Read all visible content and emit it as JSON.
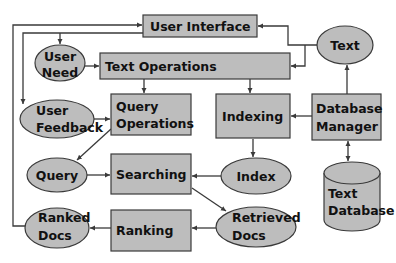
{
  "diagram": {
    "colors": {
      "background": "#ffffff",
      "node_fill": "#bdbdbd",
      "node_stroke": "#3a3a3a",
      "edge": "#3a3a3a",
      "text": "#111111"
    },
    "nodes": {
      "user_interface": {
        "shape": "rect",
        "lines": [
          "User Interface"
        ]
      },
      "text_operations": {
        "shape": "rect",
        "lines": [
          "Text Operations"
        ]
      },
      "query_operations": {
        "shape": "rect",
        "lines": [
          "Query",
          "Operations"
        ]
      },
      "indexing": {
        "shape": "rect",
        "lines": [
          "Indexing"
        ]
      },
      "database_manager": {
        "shape": "rect",
        "lines": [
          "Database",
          "Manager"
        ]
      },
      "searching": {
        "shape": "rect",
        "lines": [
          "Searching"
        ]
      },
      "ranking": {
        "shape": "rect",
        "lines": [
          "Ranking"
        ]
      },
      "user_need": {
        "shape": "ellipse",
        "lines": [
          "User",
          "Need"
        ]
      },
      "user_feedback": {
        "shape": "ellipse",
        "lines": [
          "User",
          "Feedback"
        ]
      },
      "text": {
        "shape": "ellipse",
        "lines": [
          "Text"
        ]
      },
      "query": {
        "shape": "ellipse",
        "lines": [
          "Query"
        ]
      },
      "index": {
        "shape": "ellipse",
        "lines": [
          "Index"
        ]
      },
      "retrieved_docs": {
        "shape": "ellipse",
        "lines": [
          "Retrieved",
          "Docs"
        ]
      },
      "ranked_docs": {
        "shape": "ellipse",
        "lines": [
          "Ranked",
          "Docs"
        ]
      },
      "text_database": {
        "shape": "cylinder",
        "lines": [
          "Text",
          "Database"
        ]
      }
    },
    "edges": [
      {
        "from": "text",
        "to": "user_interface"
      },
      {
        "from": "text",
        "to": "text_operations"
      },
      {
        "from": "user_interface",
        "to": "user_need"
      },
      {
        "from": "user_interface",
        "to": "user_feedback"
      },
      {
        "from": "user_need",
        "to": "text_operations"
      },
      {
        "from": "text_operations",
        "to": "query_operations"
      },
      {
        "from": "text_operations",
        "to": "indexing"
      },
      {
        "from": "user_feedback",
        "to": "query_operations"
      },
      {
        "from": "query_operations",
        "to": "query"
      },
      {
        "from": "database_manager",
        "to": "indexing"
      },
      {
        "from": "database_manager",
        "to": "text"
      },
      {
        "from": "database_manager",
        "to": "text_database",
        "bidirectional": true
      },
      {
        "from": "indexing",
        "to": "index"
      },
      {
        "from": "query",
        "to": "searching"
      },
      {
        "from": "index",
        "to": "searching"
      },
      {
        "from": "searching",
        "to": "retrieved_docs"
      },
      {
        "from": "retrieved_docs",
        "to": "ranking"
      },
      {
        "from": "ranking",
        "to": "ranked_docs"
      },
      {
        "from": "ranked_docs",
        "to": "user_interface"
      }
    ]
  }
}
